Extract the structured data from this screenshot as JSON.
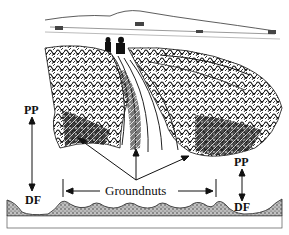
{
  "figure": {
    "labels": {
      "pp_left": "PP",
      "df_left": "DF",
      "pp_right": "PP",
      "df_right": "DF",
      "groundnuts": "Groundnuts"
    }
  }
}
